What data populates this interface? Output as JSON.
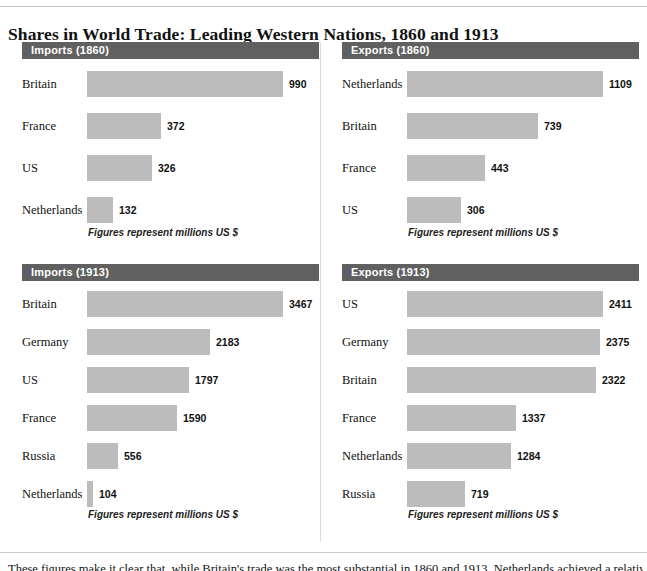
{
  "title": "Shares in World Trade: Leading Western Nations, 1860 and 1913",
  "note": "Figures represent millions US $",
  "footer_text": "These figures make it clear that, while Britain's trade was the most substantial in 1860 and 1913, Netherlands achieved a relatively",
  "colors": {
    "header_bar": "#606060",
    "bar_fill": "#bcbcbc",
    "text": "#111111",
    "rule": "#c9c9c9"
  },
  "chart_data": [
    {
      "type": "bar",
      "title": "Imports (1860)",
      "xlabel": "",
      "ylabel": "",
      "orientation": "horizontal",
      "unit": "millions US $",
      "axis_max": 990,
      "categories": [
        "Britain",
        "France",
        "US",
        "Netherlands"
      ],
      "values": [
        990,
        372,
        326,
        132
      ],
      "grid": false,
      "legend": "none"
    },
    {
      "type": "bar",
      "title": "Exports (1860)",
      "xlabel": "",
      "ylabel": "",
      "orientation": "horizontal",
      "unit": "millions US $",
      "axis_max": 1109,
      "categories": [
        "Netherlands",
        "Britain",
        "France",
        "US"
      ],
      "values": [
        1109,
        739,
        443,
        306
      ],
      "grid": false,
      "legend": "none"
    },
    {
      "type": "bar",
      "title": "Imports (1913)",
      "xlabel": "",
      "ylabel": "",
      "orientation": "horizontal",
      "unit": "millions US $",
      "axis_max": 3467,
      "categories": [
        "Britain",
        "Germany",
        "US",
        "France",
        "Russia",
        "Netherlands"
      ],
      "values": [
        3467,
        2183,
        1797,
        1590,
        556,
        104
      ],
      "grid": false,
      "legend": "none"
    },
    {
      "type": "bar",
      "title": "Exports (1913)",
      "xlabel": "",
      "ylabel": "",
      "orientation": "horizontal",
      "unit": "millions US $",
      "axis_max": 2411,
      "categories": [
        "US",
        "Germany",
        "Britain",
        "France",
        "Netherlands",
        "Russia"
      ],
      "values": [
        2411,
        2375,
        2322,
        1337,
        1284,
        719
      ],
      "grid": false,
      "legend": "none"
    }
  ],
  "panels": [
    {
      "header": "Imports (1860)",
      "note": "Figures represent millions US $",
      "rows": [
        {
          "label": "Britain",
          "value": "990"
        },
        {
          "label": "France",
          "value": "372"
        },
        {
          "label": "US",
          "value": "326"
        },
        {
          "label": "Netherlands",
          "value": "132"
        }
      ]
    },
    {
      "header": "Exports (1860)",
      "note": "Figures represent millions US $",
      "rows": [
        {
          "label": "Netherlands",
          "value": "1109"
        },
        {
          "label": "Britain",
          "value": "739"
        },
        {
          "label": "France",
          "value": "443"
        },
        {
          "label": "US",
          "value": "306"
        }
      ]
    },
    {
      "header": "Imports (1913)",
      "note": "Figures represent millions US $",
      "rows": [
        {
          "label": "Britain",
          "value": "3467"
        },
        {
          "label": "Germany",
          "value": "2183"
        },
        {
          "label": "US",
          "value": "1797"
        },
        {
          "label": "France",
          "value": "1590"
        },
        {
          "label": "Russia",
          "value": "556"
        },
        {
          "label": "Netherlands",
          "value": "104"
        }
      ]
    },
    {
      "header": "Exports (1913)",
      "note": "Figures represent millions US $",
      "rows": [
        {
          "label": "US",
          "value": "2411"
        },
        {
          "label": "Germany",
          "value": "2375"
        },
        {
          "label": "Britain",
          "value": "2322"
        },
        {
          "label": "France",
          "value": "1337"
        },
        {
          "label": "Netherlands",
          "value": "1284"
        },
        {
          "label": "Russia",
          "value": "719"
        }
      ]
    }
  ]
}
